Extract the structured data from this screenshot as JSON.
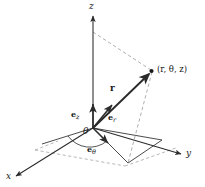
{
  "figure": {
    "kind": "cylindrical-coordinate-diagram",
    "background_color": "#ffffff",
    "line_color": "#2b2b2b",
    "dashed_color": "#8a8a8a",
    "text_color": "#1a1a1a",
    "axes": [
      {
        "id": "z",
        "label": "z",
        "direction": "up"
      },
      {
        "id": "y",
        "label": "y",
        "direction": "right-down"
      },
      {
        "id": "x",
        "label": "x",
        "direction": "left-down"
      }
    ],
    "point": {
      "label_open": "(",
      "label_r": "r",
      "sep1": ", ",
      "label_theta": "θ",
      "sep2": ", ",
      "label_z": "z",
      "label_close": ")",
      "full_label": "(r, θ, z)"
    },
    "position_vector": {
      "label": "r",
      "bold": true
    },
    "angle": {
      "label": "θ"
    },
    "unit_vectors": [
      {
        "id": "e-z",
        "base": "e",
        "subscript": "z"
      },
      {
        "id": "e-r",
        "base": "e",
        "subscript": "r"
      },
      {
        "id": "e-theta",
        "base": "e",
        "subscript": "θ"
      }
    ]
  }
}
